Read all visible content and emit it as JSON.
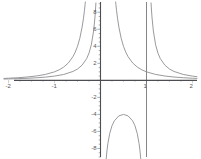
{
  "chart_data": {
    "type": "line",
    "title": "",
    "subtitle": "",
    "xlabel": "",
    "ylabel": "",
    "xlim": [
      -2.1,
      2.1
    ],
    "ylim": [
      -9.0,
      9.2
    ],
    "grid": false,
    "legend": null,
    "background": "#ffffff",
    "axis_color": "#4d4e52",
    "curve_color": "#8e8f93",
    "x_ticks": [
      {
        "value": -2,
        "label": "-2"
      },
      {
        "value": -1,
        "label": "-1"
      },
      {
        "value": 1,
        "label": "1"
      },
      {
        "value": 2,
        "label": "2"
      }
    ],
    "y_ticks": [
      {
        "value": 8,
        "label": "8"
      },
      {
        "value": 6,
        "label": "6"
      },
      {
        "value": 4,
        "label": "4"
      },
      {
        "value": 2,
        "label": "2"
      },
      {
        "value": -2,
        "label": "-2"
      },
      {
        "value": -4,
        "label": "-4"
      },
      {
        "value": -6,
        "label": "-6"
      },
      {
        "value": -8,
        "label": "-8"
      }
    ],
    "x_minor_tick_step": 0.25,
    "y_minor_tick_step": 0.5,
    "asymptotes": [
      {
        "orientation": "vertical",
        "value": 0
      },
      {
        "orientation": "vertical",
        "value": 1
      },
      {
        "orientation": "horizontal",
        "value": 0
      },
      {
        "orientation": "horizontal",
        "value": 1
      }
    ],
    "series": [
      {
        "name": "curve-a",
        "expression": "1/(x*x)",
        "color": "#8e8f93",
        "branches": [
          {
            "name": "curve-a-left",
            "points": [
              [
                -2.1,
                0.227
              ],
              [
                -2.0,
                0.25
              ],
              [
                -1.8,
                0.309
              ],
              [
                -1.6,
                0.391
              ],
              [
                -1.4,
                0.51
              ],
              [
                -1.2,
                0.694
              ],
              [
                -1.0,
                1.0
              ],
              [
                -0.9,
                1.235
              ],
              [
                -0.8,
                1.563
              ],
              [
                -0.7,
                2.041
              ],
              [
                -0.6,
                2.778
              ],
              [
                -0.55,
                3.306
              ],
              [
                -0.5,
                4.0
              ],
              [
                -0.45,
                4.938
              ],
              [
                -0.4,
                6.25
              ],
              [
                -0.37,
                7.305
              ],
              [
                -0.35,
                8.163
              ],
              [
                -0.335,
                8.91
              ],
              [
                -0.33,
                9.2
              ]
            ]
          },
          {
            "name": "curve-a-right",
            "points": [
              [
                0.33,
                9.2
              ],
              [
                0.335,
                8.91
              ],
              [
                0.35,
                8.163
              ],
              [
                0.37,
                7.305
              ],
              [
                0.4,
                6.25
              ],
              [
                0.45,
                4.938
              ],
              [
                0.5,
                4.0
              ],
              [
                0.55,
                3.306
              ],
              [
                0.6,
                2.778
              ],
              [
                0.7,
                2.041
              ],
              [
                0.8,
                1.563
              ],
              [
                0.9,
                1.235
              ],
              [
                1.0,
                1.0
              ],
              [
                1.2,
                0.694
              ],
              [
                1.4,
                0.51
              ],
              [
                1.6,
                0.391
              ],
              [
                1.8,
                0.309
              ],
              [
                2.0,
                0.25
              ],
              [
                2.1,
                0.227
              ]
            ]
          }
        ]
      },
      {
        "name": "curve-b",
        "expression": "1/(x*(x-1))",
        "color": "#8e8f93",
        "branches": [
          {
            "name": "curve-b-left",
            "points": [
              [
                -2.1,
                0.154
              ],
              [
                -2.0,
                0.167
              ],
              [
                -1.8,
                0.198
              ],
              [
                -1.6,
                0.24
              ],
              [
                -1.4,
                0.298
              ],
              [
                -1.2,
                0.379
              ],
              [
                -1.0,
                0.5
              ],
              [
                -0.8,
                0.694
              ],
              [
                -0.6,
                1.042
              ],
              [
                -0.5,
                1.333
              ],
              [
                -0.4,
                1.786
              ],
              [
                -0.3,
                2.564
              ],
              [
                -0.25,
                3.2
              ],
              [
                -0.2,
                4.167
              ],
              [
                -0.15,
                5.797
              ],
              [
                -0.12,
                7.44
              ],
              [
                -0.105,
                8.62
              ],
              [
                -0.1,
                9.09
              ]
            ]
          },
          {
            "name": "curve-b-middle",
            "points": [
              [
                0.1,
                -11.1
              ],
              [
                0.105,
                -10.6
              ],
              [
                0.12,
                -9.47
              ],
              [
                0.14,
                -8.3
              ],
              [
                0.16,
                -7.44
              ],
              [
                0.2,
                -6.25
              ],
              [
                0.25,
                -5.33
              ],
              [
                0.3,
                -4.76
              ],
              [
                0.4,
                -4.17
              ],
              [
                0.5,
                -4.0
              ],
              [
                0.6,
                -4.17
              ],
              [
                0.7,
                -4.76
              ],
              [
                0.75,
                -5.33
              ],
              [
                0.8,
                -6.25
              ],
              [
                0.84,
                -7.44
              ],
              [
                0.86,
                -8.3
              ],
              [
                0.88,
                -9.47
              ],
              [
                0.9,
                -11.1
              ]
            ]
          },
          {
            "name": "curve-b-right",
            "points": [
              [
                1.1,
                9.09
              ],
              [
                1.105,
                8.62
              ],
              [
                1.12,
                7.44
              ],
              [
                1.15,
                5.797
              ],
              [
                1.2,
                4.167
              ],
              [
                1.25,
                3.2
              ],
              [
                1.3,
                2.564
              ],
              [
                1.4,
                1.786
              ],
              [
                1.5,
                1.333
              ],
              [
                1.6,
                1.042
              ],
              [
                1.8,
                0.694
              ],
              [
                2.0,
                0.5
              ],
              [
                2.1,
                0.431
              ]
            ]
          }
        ]
      }
    ]
  }
}
